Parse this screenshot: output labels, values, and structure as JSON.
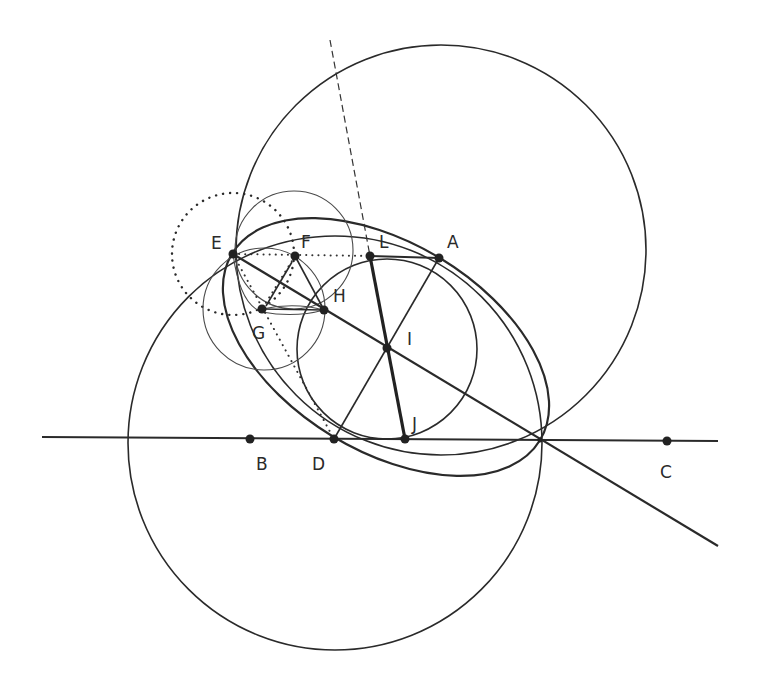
{
  "diagram": {
    "points": [
      {
        "id": "A",
        "label": "A"
      },
      {
        "id": "B",
        "label": "B"
      },
      {
        "id": "C",
        "label": "C"
      },
      {
        "id": "D",
        "label": "D"
      },
      {
        "id": "E",
        "label": "E"
      },
      {
        "id": "F",
        "label": "F"
      },
      {
        "id": "G",
        "label": "G"
      },
      {
        "id": "H",
        "label": "H"
      },
      {
        "id": "I",
        "label": "I"
      },
      {
        "id": "J",
        "label": "J"
      },
      {
        "id": "L",
        "label": "L"
      }
    ],
    "elements": [
      {
        "type": "line",
        "name": "line BC",
        "style": "solid"
      },
      {
        "type": "line",
        "name": "line through E, H, I",
        "style": "solid"
      },
      {
        "type": "segment",
        "name": "LJ",
        "style": "bold"
      },
      {
        "type": "segment",
        "name": "LA",
        "style": "solid"
      },
      {
        "type": "segment",
        "name": "DA through I",
        "style": "solid"
      },
      {
        "type": "segment",
        "name": "EL",
        "style": "dotted"
      },
      {
        "type": "line",
        "name": "dashed line through L",
        "style": "dashed"
      },
      {
        "type": "circle",
        "name": "upper large circle",
        "style": "solid"
      },
      {
        "type": "circle",
        "name": "lower large circle",
        "style": "solid"
      },
      {
        "type": "ellipse",
        "name": "ellipse through E, A, D",
        "style": "solid"
      },
      {
        "type": "circle",
        "name": "circle centered I",
        "style": "solid"
      },
      {
        "type": "circle",
        "name": "circle centered E",
        "style": "dotted"
      },
      {
        "type": "circle",
        "name": "circle centered F",
        "style": "thin"
      },
      {
        "type": "circle",
        "name": "circle centered G",
        "style": "thin"
      },
      {
        "type": "triangle",
        "name": "triangle FGH",
        "style": "solid"
      }
    ]
  }
}
